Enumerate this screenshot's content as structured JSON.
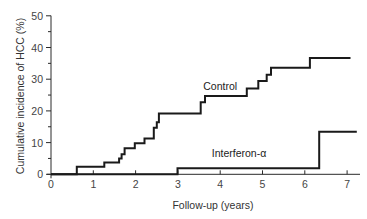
{
  "chart_data": {
    "type": "line",
    "subtype": "step (Kaplan-Meier style cumulative incidence)",
    "title": "",
    "xlabel": "Follow-up (years)",
    "ylabel": "Cumulative incidence of HCC (%)",
    "xlim": [
      0,
      7.3
    ],
    "ylim": [
      0,
      50
    ],
    "x_ticks": [
      0,
      1,
      2,
      3,
      4,
      5,
      6,
      7
    ],
    "y_ticks": [
      0,
      10,
      20,
      30,
      40,
      50
    ],
    "y_minor_ticks": [
      5,
      15,
      25,
      35,
      45
    ],
    "grid": false,
    "legend": "inline labels",
    "series": [
      {
        "name": "Control",
        "label_position": {
          "x": 3.6,
          "y": 26.5
        },
        "points": [
          [
            0,
            0
          ],
          [
            0.61,
            0
          ],
          [
            0.61,
            2.4
          ],
          [
            1.26,
            2.4
          ],
          [
            1.26,
            3.7
          ],
          [
            1.61,
            3.7
          ],
          [
            1.61,
            5.0
          ],
          [
            1.67,
            5.0
          ],
          [
            1.67,
            6.3
          ],
          [
            1.74,
            6.3
          ],
          [
            1.74,
            8.2
          ],
          [
            1.98,
            8.2
          ],
          [
            1.98,
            9.8
          ],
          [
            2.21,
            9.8
          ],
          [
            2.21,
            11.3
          ],
          [
            2.43,
            11.3
          ],
          [
            2.43,
            14.7
          ],
          [
            2.5,
            14.7
          ],
          [
            2.5,
            16.4
          ],
          [
            2.55,
            16.4
          ],
          [
            2.55,
            19.2
          ],
          [
            3.54,
            19.2
          ],
          [
            3.54,
            22.7
          ],
          [
            3.64,
            22.7
          ],
          [
            3.64,
            24.7
          ],
          [
            4.63,
            24.7
          ],
          [
            4.63,
            27.1
          ],
          [
            4.9,
            27.1
          ],
          [
            4.9,
            29.4
          ],
          [
            5.1,
            29.4
          ],
          [
            5.1,
            31.4
          ],
          [
            5.2,
            31.4
          ],
          [
            5.2,
            33.6
          ],
          [
            6.12,
            33.6
          ],
          [
            6.12,
            36.7
          ],
          [
            7.08,
            36.7
          ]
        ]
      },
      {
        "name": "Interferon-α",
        "label_position": {
          "x": 3.8,
          "y": 5.5
        },
        "points": [
          [
            0,
            0
          ],
          [
            2.99,
            0
          ],
          [
            2.99,
            1.9
          ],
          [
            6.34,
            1.9
          ],
          [
            6.34,
            13.4
          ],
          [
            7.23,
            13.4
          ]
        ]
      }
    ]
  },
  "plot_area": {
    "x0_px": 51,
    "x_px_per_unit": 42.3,
    "y0_px": 174.3,
    "y_px_per_unit": 3.17,
    "x_axis_end_px": 360,
    "y_axis_top_px": 15.7
  },
  "colors": {
    "line": "#1a1a1a",
    "axis": "#2a2a2a",
    "text": "#444444",
    "background": "#ffffff"
  }
}
